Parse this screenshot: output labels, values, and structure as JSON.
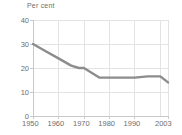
{
  "chart_data": {
    "type": "line",
    "title": "",
    "axis_unit_label": "Per cent",
    "xlabel": "",
    "ylabel": "Per cent",
    "xlim": [
      1950,
      2003
    ],
    "ylim": [
      0,
      40
    ],
    "yticks": [
      0,
      10,
      20,
      30,
      40
    ],
    "ytick_labels": [
      "0",
      "10",
      "20",
      "30",
      "40"
    ],
    "xticks": [
      1950,
      1960,
      1970,
      1980,
      1990,
      2003
    ],
    "xtick_labels": [
      "1950",
      "1960",
      "1970",
      "1980",
      "1990",
      "2003"
    ],
    "grid": true,
    "legend": "none",
    "series": [
      {
        "name": "Per cent",
        "color": "#8c8c8c",
        "x": [
          1950,
          1955,
          1960,
          1965,
          1968,
          1970,
          1973,
          1976,
          1980,
          1985,
          1990,
          1995,
          2000,
          2003
        ],
        "values": [
          30,
          27,
          24,
          21,
          20,
          20,
          18,
          16,
          16,
          16,
          16,
          16.5,
          16.5,
          14
        ]
      }
    ]
  },
  "labels": {
    "unit_caption": "Per cent"
  }
}
